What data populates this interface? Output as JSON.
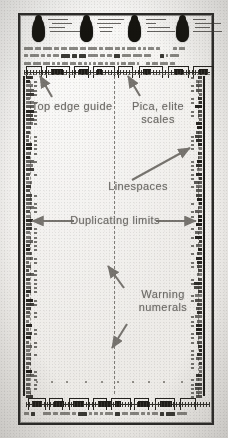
{
  "document": {
    "type": "scanned-typing-guide-sheet",
    "title": "Typist's duplicating guide sheet",
    "page_background": "#f4f2ef",
    "ink_color": "#24221e",
    "annotation_color": "#6f6d69"
  },
  "annotations": [
    {
      "id": "top-edge-guide",
      "label": "Top edge guide",
      "points_to": "top horizontal dashed guide line",
      "arrow": "up-right"
    },
    {
      "id": "pica-elite-scales",
      "label": "Pica, elite\nscales",
      "points_to": "top horizontal scale bar",
      "arrow": "up-left"
    },
    {
      "id": "linespaces",
      "label": "Linespaces",
      "points_to": "right vertical edge ruler",
      "arrow": "up-right"
    },
    {
      "id": "duplicating-limits",
      "label": "Duplicating limits",
      "points_to": "left and right vertical rulers",
      "arrow": "double-horizontal"
    },
    {
      "id": "warning-numerals",
      "label": "Warning\nnumerals",
      "points_to": "center dashed column of numerals",
      "arrow": "up-left-and-down-left"
    }
  ],
  "sheet_features": {
    "tab_count": 4,
    "top_scale_label": "pica and elite typewriter scales",
    "bottom_scale_label": "pica and elite typewriter scales",
    "left_ruler": "linespace ruler",
    "right_ruler": "linespace ruler",
    "center_guide": "vertical dashed centre line",
    "microtext_rows": 3
  }
}
